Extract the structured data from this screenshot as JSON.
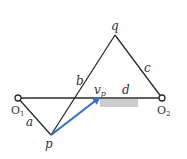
{
  "diagram": {
    "type": "four-bar linkage velocity diagram",
    "points": {
      "O1": {
        "label": "O",
        "subscript": "1",
        "x": 18,
        "y": 98
      },
      "O2": {
        "label": "O",
        "subscript": "2",
        "x": 162,
        "y": 98
      },
      "p": {
        "label": "p",
        "x": 51,
        "y": 135
      },
      "q": {
        "label": "q",
        "x": 115,
        "y": 35
      }
    },
    "links": [
      {
        "name": "a",
        "label": "a",
        "from": "O1",
        "to": "p"
      },
      {
        "name": "b",
        "label": "b",
        "from": "p",
        "to": "q"
      },
      {
        "name": "c",
        "label": "c",
        "from": "q",
        "to": "O2"
      },
      {
        "name": "d",
        "label": "d",
        "from": "O1",
        "to": "O2"
      }
    ],
    "vector": {
      "label": "v",
      "subscript": "p",
      "color": "#3a6fc9"
    },
    "highlight": {
      "color": "#cccccc"
    },
    "line_color": "#2b2b2b"
  }
}
